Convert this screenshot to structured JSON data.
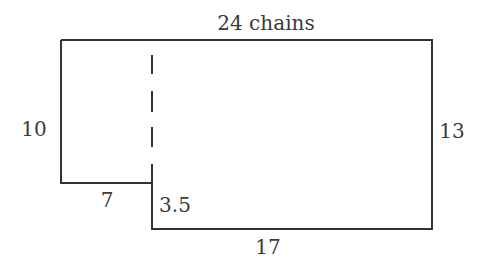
{
  "diagram": {
    "type": "land-plot-outline",
    "labels": {
      "top": "24 chains",
      "left": "10",
      "right": "13",
      "step_bottom": "7",
      "step_side": "3.5",
      "bottom": "17"
    },
    "colors": {
      "line": "#333333",
      "text": "#3a3a3a",
      "background": "#ffffff"
    }
  }
}
